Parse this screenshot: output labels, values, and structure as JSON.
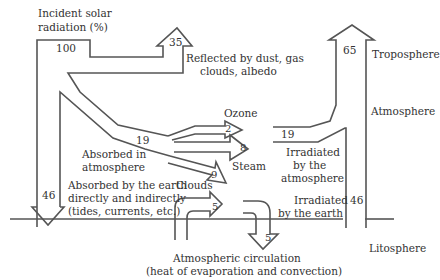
{
  "diagram": {
    "type": "energy-flow (Sankey-style)",
    "labels": {
      "incident_line1": "Incident solar",
      "incident_line2": "radiation (%)",
      "reflected_line1": "Reflected by dust, gas",
      "reflected_line2": "clouds, albedo",
      "ozone": "Ozone",
      "steam": "Steam",
      "clouds": "Clouds",
      "absorbed_atm_line1": "Absorbed in",
      "absorbed_atm_line2": "atmosphere",
      "absorbed_earth_line1": "Absorbed by the earth",
      "absorbed_earth_line2": "directly and indirectly",
      "absorbed_earth_line3": "(tides, currents, etc.)",
      "irr_atm_line1": "Irradiated",
      "irr_atm_line2": "by the",
      "irr_atm_line3": "atmosphere",
      "irr_earth_line1": "Irradiated",
      "irr_earth_line2": "by the earth",
      "circ_line1": "Atmospheric circulation",
      "circ_line2": "(heat of evaporation and convection)",
      "troposphere": "Troposphere",
      "atmosphere": "Atmosphere",
      "litosphere": "Litosphere"
    },
    "values": {
      "incident": "100",
      "reflected": "35",
      "absorbed_atmosphere": "19",
      "ozone": "2",
      "steam": "8",
      "clouds": "9",
      "absorbed_earth": "46",
      "circulation_up": "5",
      "circulation_down": "5",
      "irradiated_atmosphere": "19",
      "irradiated_earth": "46",
      "outgoing": "65"
    },
    "colors": {
      "stroke": "#555555",
      "text": "#333333",
      "background": "#ffffff"
    }
  }
}
